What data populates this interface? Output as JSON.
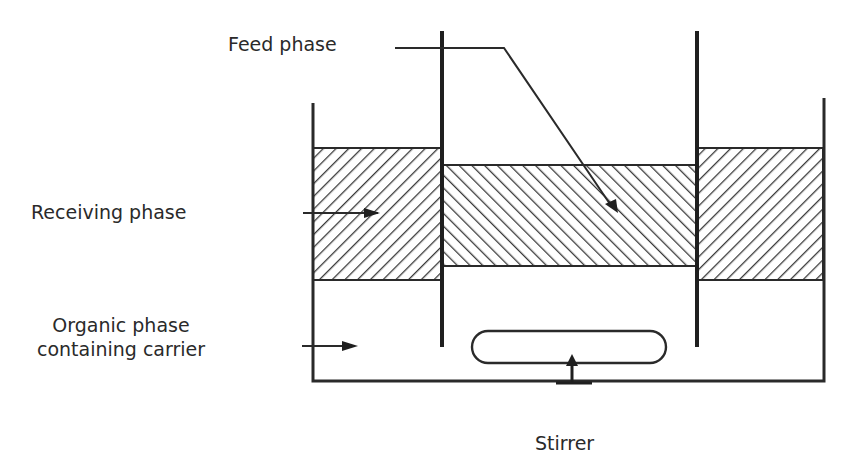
{
  "diagram": {
    "type": "apparatus-schematic",
    "labels": {
      "feed_phase": "Feed phase",
      "receiving_phase": "Receiving phase",
      "organic_phase_line1": "Organic phase",
      "organic_phase_line2": "containing carrier",
      "stirrer": "Stirrer"
    },
    "colors": {
      "line": "#2a2a2a",
      "background": "#ffffff"
    },
    "regions": [
      {
        "name": "receiving-phase-left",
        "hatch": "forward"
      },
      {
        "name": "feed-phase-center",
        "hatch": "backward"
      },
      {
        "name": "receiving-phase-right",
        "hatch": "forward"
      },
      {
        "name": "organic-phase-bottom",
        "hatch": "none"
      }
    ]
  }
}
